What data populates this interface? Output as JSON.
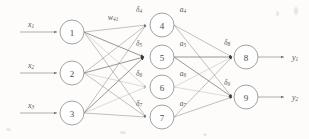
{
  "figure": {
    "background_color": "#fdfcfb",
    "line_color": "#8d8d8d",
    "node_stroke_color": "#8a8a8a",
    "node_fill_color": "#fefefe",
    "arrow_dark_color": "#3d3d3d",
    "arrow_mid_color": "#6f6f6f",
    "arrow_light_color": "#b9b9b9"
  },
  "layers": {
    "input": {
      "name": "input-layer",
      "nodes": [
        {
          "id": "1",
          "label": "1",
          "cx": 72,
          "cy": 32,
          "r": 12,
          "input_label": "x",
          "input_sub": "1"
        },
        {
          "id": "2",
          "label": "2",
          "cx": 72,
          "cy": 73,
          "r": 12,
          "input_label": "x",
          "input_sub": "2"
        },
        {
          "id": "3",
          "label": "3",
          "cx": 72,
          "cy": 113,
          "r": 12,
          "input_label": "x",
          "input_sub": "3"
        }
      ]
    },
    "hidden": {
      "name": "hidden-layer",
      "nodes": [
        {
          "id": "4",
          "label": "4",
          "cx": 162,
          "cy": 25,
          "r": 12,
          "delta": "δ",
          "delta_sub": "4",
          "activation": "a",
          "activation_sub": "4",
          "arrow_tone": "mid"
        },
        {
          "id": "5",
          "label": "5",
          "cx": 162,
          "cy": 57,
          "r": 12,
          "delta": "δ",
          "delta_sub": "5",
          "activation": "a",
          "activation_sub": "5",
          "arrow_tone": "dark"
        },
        {
          "id": "6",
          "label": "6",
          "cx": 162,
          "cy": 87,
          "r": 12,
          "delta": "δ",
          "delta_sub": "6",
          "activation": "a",
          "activation_sub": "6",
          "arrow_tone": "light"
        },
        {
          "id": "7",
          "label": "7",
          "cx": 162,
          "cy": 117,
          "r": 12,
          "delta": "δ",
          "delta_sub": "7",
          "activation": "a",
          "activation_sub": "7",
          "arrow_tone": "mid"
        }
      ]
    },
    "output": {
      "name": "output-layer",
      "nodes": [
        {
          "id": "8",
          "label": "8",
          "cx": 246,
          "cy": 57,
          "r": 12,
          "delta": "δ",
          "delta_sub": "8",
          "output_label": "y",
          "output_sub": "1",
          "arrow_tone": "dark"
        },
        {
          "id": "9",
          "label": "9",
          "cx": 246,
          "cy": 97,
          "r": 12,
          "delta": "δ",
          "delta_sub": "9",
          "output_label": "y",
          "output_sub": "2",
          "arrow_tone": "dark"
        }
      ]
    }
  },
  "annotations": {
    "weight_label": {
      "symbol": "w",
      "subscript": "41",
      "x": 113,
      "y": 17
    }
  },
  "edges": {
    "input_to_hidden_note": "fully connected: 3 inputs x 4 hidden = 12 edges",
    "hidden_to_output_note": "fully connected: 4 hidden x 2 output = 8 edges"
  }
}
